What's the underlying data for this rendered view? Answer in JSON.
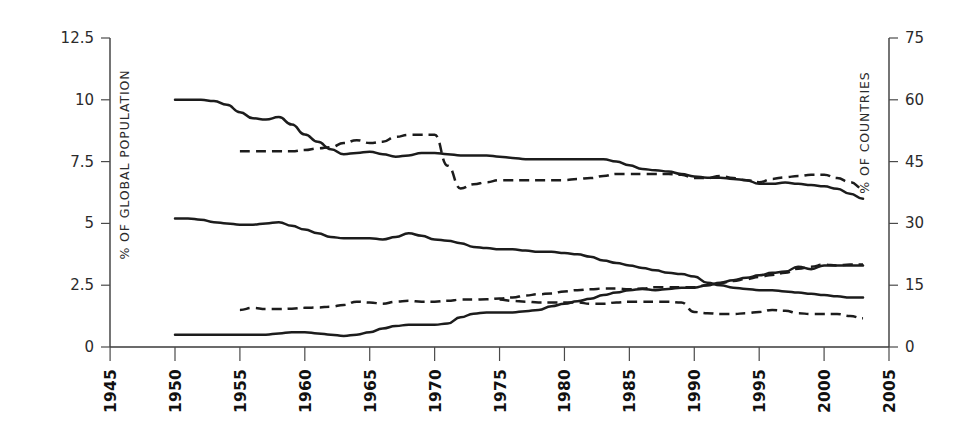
{
  "chart_data": {
    "type": "line",
    "title": "",
    "subtitle": "",
    "xlabel": "",
    "ylabel": "% OF GLOBAL POPULATION",
    "y2label": "% OF COUNTRIES",
    "xlim": [
      1945,
      2005
    ],
    "ylim": [
      0,
      12.5
    ],
    "y2lim": [
      0,
      75
    ],
    "xticks": [
      1945,
      1950,
      1955,
      1960,
      1965,
      1970,
      1975,
      1980,
      1985,
      1990,
      1995,
      2000,
      2005
    ],
    "xtick_labels": [
      "1945",
      "1950",
      "1955",
      "1960",
      "1965",
      "1970",
      "1975",
      "1980",
      "1985",
      "1990",
      "1995",
      "2000",
      "2005"
    ],
    "yticks": [
      0,
      2.5,
      5,
      7.5,
      10,
      12.5
    ],
    "ytick_labels": [
      "0",
      "2.5",
      "5",
      "7.5",
      "10",
      "12.5"
    ],
    "y2ticks": [
      0,
      15,
      30,
      45,
      60,
      75
    ],
    "y2tick_labels": [
      "0",
      "15",
      "30",
      "45",
      "60",
      "75"
    ],
    "grid": false,
    "legend": "none",
    "axis_color": "#3a3a3a",
    "line_color": "#1c1c1c",
    "series": [
      {
        "name": "upper-solid-population",
        "axis": "left",
        "style": "solid",
        "x": [
          1950,
          1951,
          1952,
          1953,
          1954,
          1955,
          1956,
          1957,
          1958,
          1959,
          1960,
          1961,
          1962,
          1963,
          1964,
          1965,
          1966,
          1967,
          1968,
          1969,
          1970,
          1971,
          1972,
          1973,
          1974,
          1975,
          1976,
          1977,
          1978,
          1979,
          1980,
          1981,
          1982,
          1983,
          1984,
          1985,
          1986,
          1987,
          1988,
          1989,
          1990,
          1991,
          1992,
          1993,
          1994,
          1995,
          1996,
          1997,
          1998,
          1999,
          2000,
          2001,
          2002,
          2003
        ],
        "values": [
          10.0,
          10.0,
          10.0,
          9.95,
          9.8,
          9.5,
          9.25,
          9.2,
          9.3,
          9.0,
          8.6,
          8.3,
          8.0,
          7.8,
          7.85,
          7.9,
          7.8,
          7.7,
          7.75,
          7.85,
          7.85,
          7.8,
          7.75,
          7.75,
          7.75,
          7.7,
          7.65,
          7.6,
          7.6,
          7.6,
          7.6,
          7.6,
          7.6,
          7.6,
          7.5,
          7.35,
          7.2,
          7.15,
          7.1,
          7.0,
          6.9,
          6.85,
          6.85,
          6.8,
          6.75,
          6.6,
          6.6,
          6.65,
          6.6,
          6.55,
          6.5,
          6.4,
          6.2,
          6.0
        ]
      },
      {
        "name": "upper-dashed-countries",
        "axis": "right",
        "style": "dashed",
        "x": [
          1955,
          1956,
          1957,
          1958,
          1959,
          1960,
          1961,
          1962,
          1963,
          1964,
          1965,
          1966,
          1967,
          1968,
          1969,
          1970,
          1971,
          1972,
          1973,
          1974,
          1975,
          1976,
          1977,
          1978,
          1979,
          1980,
          1981,
          1982,
          1983,
          1984,
          1985,
          1986,
          1987,
          1988,
          1989,
          1990,
          1991,
          1992,
          1993,
          1994,
          1995,
          1996,
          1997,
          1998,
          1999,
          2000,
          2001,
          2002,
          2003
        ],
        "values": [
          47.5,
          47.5,
          47.5,
          47.5,
          47.5,
          47.8,
          48.2,
          48.5,
          49.5,
          50.2,
          49.5,
          49.8,
          51.0,
          51.5,
          51.5,
          51.5,
          44.0,
          38.5,
          39.5,
          40.0,
          40.5,
          40.5,
          40.5,
          40.5,
          40.5,
          40.5,
          40.8,
          41.0,
          41.5,
          42.0,
          42.0,
          42.0,
          42.0,
          42.0,
          41.8,
          41.0,
          41.0,
          41.5,
          41.0,
          40.5,
          40.0,
          40.8,
          41.2,
          41.5,
          41.8,
          41.8,
          41.0,
          40.0,
          38.5
        ]
      },
      {
        "name": "middle-solid-population",
        "axis": "left",
        "style": "solid",
        "x": [
          1950,
          1951,
          1952,
          1953,
          1954,
          1955,
          1956,
          1957,
          1958,
          1959,
          1960,
          1961,
          1962,
          1963,
          1964,
          1965,
          1966,
          1967,
          1968,
          1969,
          1970,
          1971,
          1972,
          1973,
          1974,
          1975,
          1976,
          1977,
          1978,
          1979,
          1980,
          1981,
          1982,
          1983,
          1984,
          1985,
          1986,
          1987,
          1988,
          1989,
          1990,
          1991,
          1992,
          1993,
          1994,
          1995,
          1996,
          1997,
          1998,
          1999,
          2000,
          2001,
          2002,
          2003
        ],
        "values": [
          5.2,
          5.2,
          5.15,
          5.05,
          5.0,
          4.95,
          4.95,
          5.0,
          5.05,
          4.9,
          4.75,
          4.6,
          4.45,
          4.4,
          4.4,
          4.4,
          4.35,
          4.45,
          4.6,
          4.5,
          4.35,
          4.3,
          4.2,
          4.05,
          4.0,
          3.95,
          3.95,
          3.9,
          3.85,
          3.85,
          3.8,
          3.75,
          3.65,
          3.5,
          3.4,
          3.3,
          3.2,
          3.1,
          3.0,
          2.95,
          2.85,
          2.6,
          2.5,
          2.4,
          2.35,
          2.3,
          2.3,
          2.25,
          2.2,
          2.15,
          2.1,
          2.05,
          2.0,
          2.0
        ]
      },
      {
        "name": "middle-dashed-countries",
        "axis": "right",
        "style": "dashed",
        "x": [
          1955,
          1956,
          1957,
          1958,
          1959,
          1960,
          1961,
          1962,
          1963,
          1964,
          1965,
          1966,
          1967,
          1968,
          1969,
          1970,
          1971,
          1972,
          1973,
          1974,
          1975,
          1976,
          1977,
          1978,
          1979,
          1980,
          1981,
          1982,
          1983,
          1984,
          1985,
          1986,
          1987,
          1988,
          1989,
          1990,
          1991,
          1992,
          1993,
          1994,
          1995,
          1996,
          1997,
          1998,
          1999,
          2000,
          2001,
          2002,
          2003
        ],
        "values": [
          9.0,
          9.5,
          9.2,
          9.2,
          9.3,
          9.5,
          9.6,
          9.8,
          10.2,
          11.0,
          10.8,
          10.5,
          11.0,
          11.2,
          11.0,
          11.0,
          11.2,
          11.5,
          11.5,
          11.6,
          11.8,
          12.0,
          12.5,
          12.8,
          13.0,
          13.5,
          13.8,
          14.0,
          14.2,
          14.2,
          14.0,
          14.2,
          14.5,
          14.5,
          14.5,
          14.5,
          15.0,
          15.5,
          16.0,
          16.5,
          17.0,
          17.5,
          18.0,
          19.0,
          19.5,
          20.0,
          19.8,
          20.0,
          20.0
        ]
      },
      {
        "name": "lower-solid-population",
        "axis": "left",
        "style": "solid",
        "x": [
          1950,
          1951,
          1952,
          1953,
          1954,
          1955,
          1956,
          1957,
          1958,
          1959,
          1960,
          1961,
          1962,
          1963,
          1964,
          1965,
          1966,
          1967,
          1968,
          1969,
          1970,
          1971,
          1972,
          1973,
          1974,
          1975,
          1976,
          1977,
          1978,
          1979,
          1980,
          1981,
          1982,
          1983,
          1984,
          1985,
          1986,
          1987,
          1988,
          1989,
          1990,
          1991,
          1992,
          1993,
          1994,
          1995,
          1996,
          1997,
          1998,
          1999,
          2000,
          2001,
          2002,
          2003
        ],
        "values": [
          0.5,
          0.5,
          0.5,
          0.5,
          0.5,
          0.5,
          0.5,
          0.5,
          0.55,
          0.6,
          0.6,
          0.55,
          0.5,
          0.45,
          0.5,
          0.6,
          0.75,
          0.85,
          0.9,
          0.9,
          0.9,
          0.95,
          1.2,
          1.35,
          1.4,
          1.4,
          1.4,
          1.45,
          1.5,
          1.65,
          1.75,
          1.85,
          1.95,
          2.1,
          2.2,
          2.3,
          2.35,
          2.3,
          2.35,
          2.4,
          2.4,
          2.5,
          2.6,
          2.7,
          2.8,
          2.9,
          3.0,
          3.05,
          3.25,
          3.15,
          3.3,
          3.3,
          3.3,
          3.3
        ]
      },
      {
        "name": "lower-dashed-countries",
        "axis": "right",
        "style": "dashed",
        "x": [
          1975,
          1976,
          1977,
          1978,
          1979,
          1980,
          1981,
          1982,
          1983,
          1984,
          1985,
          1986,
          1987,
          1988,
          1989,
          1990,
          1991,
          1992,
          1993,
          1994,
          1995,
          1996,
          1997,
          1998,
          1999,
          2000,
          2001,
          2002,
          2003
        ],
        "values": [
          11.5,
          11.2,
          11.0,
          10.8,
          10.8,
          10.8,
          10.8,
          10.5,
          10.5,
          10.8,
          11.0,
          11.0,
          11.0,
          11.0,
          10.8,
          8.5,
          8.2,
          8.0,
          8.0,
          8.2,
          8.5,
          9.0,
          8.8,
          8.2,
          8.0,
          8.0,
          8.0,
          7.5,
          7.0
        ]
      }
    ]
  }
}
